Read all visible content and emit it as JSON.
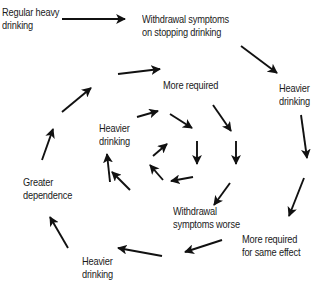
{
  "diagram": {
    "type": "spiral-cycle",
    "colors": {
      "arrow": "#111111",
      "text": "#1a1a1a",
      "background": "#ffffff"
    },
    "nodes": [
      {
        "id": "regular-heavy-drinking",
        "lines": [
          "Regular heavy",
          "drinking"
        ],
        "x": 2,
        "y": 6
      },
      {
        "id": "withdrawal-on-stopping",
        "lines": [
          "Withdrawal symptoms",
          "on stopping drinking"
        ],
        "x": 142,
        "y": 13
      },
      {
        "id": "heavier-drinking-outer-right",
        "lines": [
          "Heavier",
          "drinking"
        ],
        "x": 279,
        "y": 82
      },
      {
        "id": "more-required-same-effect",
        "lines": [
          "More required",
          "for same effect"
        ],
        "x": 242,
        "y": 233
      },
      {
        "id": "heavier-drinking-outer-bottom",
        "lines": [
          "Heavier",
          "drinking"
        ],
        "x": 82,
        "y": 255
      },
      {
        "id": "greater-dependence",
        "lines": [
          "Greater",
          "dependence"
        ],
        "x": 23,
        "y": 176
      },
      {
        "id": "more-required-inner",
        "lines": [
          "More required"
        ],
        "x": 163,
        "y": 79
      },
      {
        "id": "heavier-drinking-inner",
        "lines": [
          "Heavier",
          "drinking"
        ],
        "x": 99,
        "y": 122
      },
      {
        "id": "withdrawal-symptoms-worse",
        "lines": [
          "Withdrawal",
          "symptoms worse"
        ],
        "x": 173,
        "y": 205
      }
    ],
    "arrows": [
      {
        "x1": 62,
        "y1": 19,
        "x2": 125,
        "y2": 19
      },
      {
        "x1": 241,
        "y1": 46,
        "x2": 277,
        "y2": 73
      },
      {
        "x1": 301,
        "y1": 115,
        "x2": 307,
        "y2": 158
      },
      {
        "x1": 304,
        "y1": 178,
        "x2": 289,
        "y2": 216
      },
      {
        "x1": 222,
        "y1": 240,
        "x2": 185,
        "y2": 252
      },
      {
        "x1": 162,
        "y1": 256,
        "x2": 118,
        "y2": 248
      },
      {
        "x1": 68,
        "y1": 248,
        "x2": 50,
        "y2": 217
      },
      {
        "x1": 42,
        "y1": 160,
        "x2": 53,
        "y2": 129
      },
      {
        "x1": 62,
        "y1": 112,
        "x2": 91,
        "y2": 88
      },
      {
        "x1": 118,
        "y1": 74,
        "x2": 160,
        "y2": 69
      },
      {
        "x1": 137,
        "y1": 117,
        "x2": 158,
        "y2": 111
      },
      {
        "x1": 170,
        "y1": 114,
        "x2": 192,
        "y2": 128
      },
      {
        "x1": 213,
        "y1": 105,
        "x2": 231,
        "y2": 131
      },
      {
        "x1": 236,
        "y1": 141,
        "x2": 236,
        "y2": 164
      },
      {
        "x1": 197,
        "y1": 141,
        "x2": 197,
        "y2": 164
      },
      {
        "x1": 230,
        "y1": 183,
        "x2": 214,
        "y2": 205
      },
      {
        "x1": 193,
        "y1": 177,
        "x2": 171,
        "y2": 181
      },
      {
        "x1": 163,
        "y1": 180,
        "x2": 150,
        "y2": 165
      },
      {
        "x1": 153,
        "y1": 156,
        "x2": 167,
        "y2": 144
      },
      {
        "x1": 130,
        "y1": 190,
        "x2": 112,
        "y2": 172
      },
      {
        "x1": 110,
        "y1": 182,
        "x2": 107,
        "y2": 154
      }
    ]
  },
  "labels": {
    "regular_heavy_drinking_1": "Regular heavy",
    "regular_heavy_drinking_2": "drinking",
    "withdrawal_on_stopping_1": "Withdrawal symptoms",
    "withdrawal_on_stopping_2": "on stopping drinking",
    "heavier_right_1": "Heavier",
    "heavier_right_2": "drinking",
    "more_required_same_1": "More required",
    "more_required_same_2": "for same effect",
    "heavier_bottom_1": "Heavier",
    "heavier_bottom_2": "drinking",
    "greater_dependence_1": "Greater",
    "greater_dependence_2": "dependence",
    "more_required_inner": "More required",
    "heavier_inner_1": "Heavier",
    "heavier_inner_2": "drinking",
    "withdrawal_worse_1": "Withdrawal",
    "withdrawal_worse_2": "symptoms worse"
  }
}
